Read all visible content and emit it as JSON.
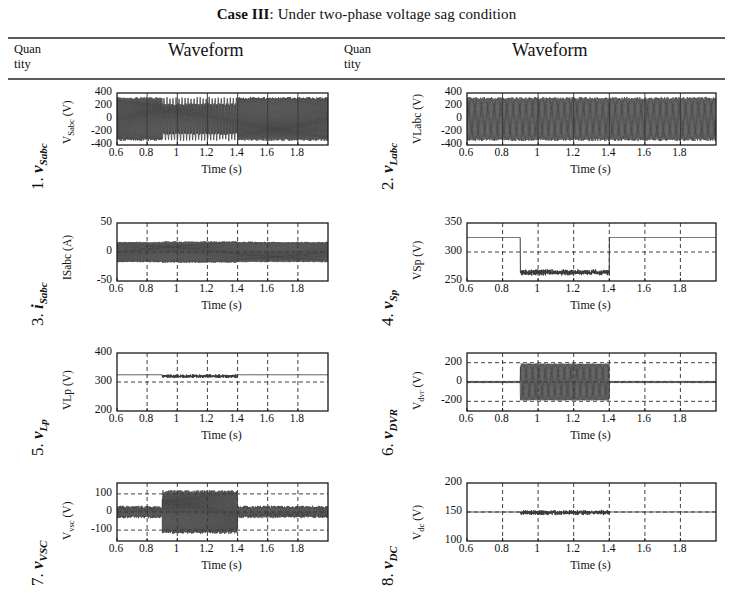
{
  "caption": {
    "bold": "Case III",
    "rest": ": Under two-phase voltage sag condition"
  },
  "table_header": {
    "col1_line1": "Quan",
    "col1_line2": "tity",
    "col2": "Waveform",
    "col3_line1": "Quan",
    "col3_line2": "tity",
    "col4": "Waveform"
  },
  "xaxis": {
    "label": "Time (s)",
    "ticks": [
      "0.6",
      "0.8",
      "1",
      "1.2",
      "1.4",
      "1.6",
      "1.8"
    ],
    "tick_values": [
      0.6,
      0.8,
      1.0,
      1.2,
      1.4,
      1.6,
      1.8
    ],
    "min": 0.6,
    "max": 2.0
  },
  "colors": {
    "trace": "#3a3a3a",
    "axis": "#1a1a1a",
    "grid": "#2b2b2b",
    "rule": "#5c5c5c"
  },
  "rows": [
    {
      "index": "1.",
      "symbol": "v",
      "sub": "Sabc",
      "chart_data": {
        "type": "line",
        "title": "",
        "xlabel": "Time (s)",
        "ylabel": "V Sabc (V)",
        "ylabel_main": "V",
        "ylabel_sub": "Sabc",
        "ylabel_unit": " (V)",
        "ylim": [
          -400,
          400
        ],
        "yticks": [
          -400,
          -200,
          0,
          200,
          400
        ],
        "ytick_labels": [
          "-400",
          "-200",
          "0",
          "200",
          "400"
        ],
        "xlim": [
          0.6,
          2.0
        ],
        "grid": "solid-vertical",
        "waveform": "three-phase-ac",
        "amplitude_normal": 325,
        "amplitude_sag": 325,
        "sag_start": 0.9,
        "sag_end": 1.4,
        "sag_amplitude": 230,
        "frequency_hz": 50,
        "description": "Source three-phase voltage, 325 V peak, two phases sag between 0.9 s and 1.4 s"
      }
    },
    {
      "index": "2.",
      "symbol": "v",
      "sub": "Labc",
      "chart_data": {
        "type": "line",
        "title": "",
        "xlabel": "Time (s)",
        "ylabel": "VLabc (V)",
        "ylabel_main": "VLabc",
        "ylabel_sub": "",
        "ylabel_unit": " (V)",
        "ylim": [
          -400,
          400
        ],
        "yticks": [
          -400,
          -200,
          0,
          200,
          400
        ],
        "ytick_labels": [
          "-400",
          "-200",
          "0",
          "200",
          "400"
        ],
        "xlim": [
          0.6,
          2.0
        ],
        "grid": "solid-vertical",
        "waveform": "three-phase-ac",
        "amplitude_normal": 325,
        "amplitude_sag": 325,
        "sag_start": 0.9,
        "sag_end": 1.4,
        "sag_amplitude": 325,
        "frequency_hz": 50,
        "description": "Load three-phase voltage held at 325 V peak throughout, DVR compensates the sag"
      }
    },
    {
      "index": "3.",
      "symbol": "i",
      "sub": "Sabc",
      "chart_data": {
        "type": "line",
        "title": "",
        "xlabel": "Time (s)",
        "ylabel": "ISabc (A)",
        "ylabel_main": "ISabc",
        "ylabel_sub": "",
        "ylabel_unit": " (A)",
        "ylim": [
          -50,
          50
        ],
        "yticks": [
          -50,
          0,
          50
        ],
        "ytick_labels": [
          "-50",
          "0",
          "50"
        ],
        "xlim": [
          0.6,
          2.0
        ],
        "grid": "dashed-vertical",
        "waveform": "three-phase-ac",
        "amplitude_normal": 17,
        "amplitude_sag": 18,
        "sag_start": 0.9,
        "sag_end": 1.4,
        "sag_amplitude": 18,
        "frequency_hz": 50,
        "description": "Source three-phase current, about 17 A peak, nearly constant across the event"
      }
    },
    {
      "index": "4.",
      "symbol": "v",
      "sub": "Sp",
      "chart_data": {
        "type": "line",
        "title": "",
        "xlabel": "Time (s)",
        "ylabel": "VSp (V)",
        "ylabel_main": "VSp",
        "ylabel_sub": "",
        "ylabel_unit": " (V)",
        "ylim": [
          250,
          350
        ],
        "yticks": [
          250,
          300,
          350
        ],
        "ytick_labels": [
          "250",
          "300",
          "350"
        ],
        "xlim": [
          0.6,
          2.0
        ],
        "grid": "dashed",
        "waveform": "step-down",
        "level_normal": 325,
        "level_sag": 265,
        "sag_start": 0.9,
        "sag_end": 1.4,
        "ripple_sag": 5,
        "description": "Source peak voltage drops from 325 V to about 265 V during 0.9 s to 1.4 s"
      }
    },
    {
      "index": "5.",
      "symbol": "v",
      "sub": "Lp",
      "chart_data": {
        "type": "line",
        "title": "",
        "xlabel": "Time (s)",
        "ylabel": "VLp (V)",
        "ylabel_main": "VLp",
        "ylabel_sub": "",
        "ylabel_unit": " (V)",
        "ylim": [
          200,
          400
        ],
        "yticks": [
          200,
          300,
          400
        ],
        "ytick_labels": [
          "200",
          "300",
          "400"
        ],
        "xlim": [
          0.6,
          2.0
        ],
        "grid": "dashed",
        "waveform": "flat-with-ripple",
        "level_normal": 325,
        "level_sag": 320,
        "sag_start": 0.9,
        "sag_end": 1.4,
        "ripple_sag": 6,
        "description": "Load peak voltage regulated at about 325 V with ripple during the sag window"
      }
    },
    {
      "index": "6.",
      "symbol": "v",
      "sub": "DVR",
      "chart_data": {
        "type": "line",
        "title": "",
        "xlabel": "Time (s)",
        "ylabel": "V dvr (V)",
        "ylabel_main": "V",
        "ylabel_sub": "dvr",
        "ylabel_unit": " (V)",
        "ylim": [
          -300,
          300
        ],
        "yticks": [
          -200,
          0,
          200
        ],
        "ytick_labels": [
          "-200",
          "0",
          "200"
        ],
        "xlim": [
          0.6,
          2.0
        ],
        "grid": "dashed",
        "waveform": "burst-ac",
        "amplitude_normal": 8,
        "amplitude_sag": 190,
        "sag_start": 0.9,
        "sag_end": 1.4,
        "frequency_hz": 50,
        "description": "DVR injected voltage near zero outside the sag and about 190 V peak during 0.9 s to 1.4 s"
      }
    },
    {
      "index": "7.",
      "symbol": "v",
      "sub": "VSC",
      "chart_data": {
        "type": "line",
        "title": "",
        "xlabel": "Time (s)",
        "ylabel": "Vvsc (V)",
        "ylabel_main": "V",
        "ylabel_sub": "vsc",
        "ylabel_unit": " (V)",
        "ylim": [
          -160,
          160
        ],
        "yticks": [
          -100,
          0,
          100
        ],
        "ytick_labels": [
          "-100",
          "0",
          "100"
        ],
        "xlim": [
          0.6,
          2.0
        ],
        "grid": "dashed",
        "waveform": "burst-ac",
        "amplitude_normal": 28,
        "amplitude_sag": 115,
        "sag_start": 0.9,
        "sag_end": 1.4,
        "frequency_hz": 50,
        "description": "VSC output voltage about 28 V peak normally, rising to about 115 V peak during the sag"
      }
    },
    {
      "index": "8.",
      "symbol": "v",
      "sub": "DC",
      "chart_data": {
        "type": "line",
        "title": "",
        "xlabel": "Time (s)",
        "ylabel": "Vdc (V)",
        "ylabel_main": "V",
        "ylabel_sub": "dc",
        "ylabel_unit": " (V)",
        "ylim": [
          100,
          200
        ],
        "yticks": [
          100,
          150,
          200
        ],
        "ytick_labels": [
          "100",
          "150",
          "200"
        ],
        "xlim": [
          0.6,
          2.0
        ],
        "grid": "dashed",
        "waveform": "flat-with-ripple",
        "level_normal": 150,
        "level_sag": 149,
        "sag_start": 0.9,
        "sag_end": 1.4,
        "ripple_sag": 4,
        "description": "DC-link voltage held at about 150 V with small ripple during the sag window"
      }
    }
  ]
}
